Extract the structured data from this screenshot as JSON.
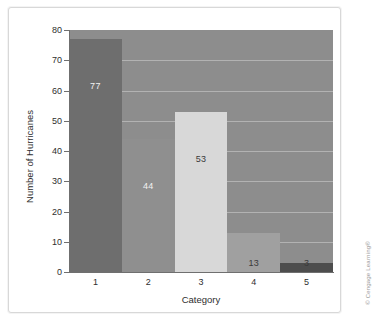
{
  "figure": {
    "credit": "© Cengage Learning®"
  },
  "chart_data": {
    "type": "bar",
    "title": "",
    "xlabel": "Category",
    "ylabel": "Number of Hurricanes",
    "categories": [
      "1",
      "2",
      "3",
      "4",
      "5"
    ],
    "values": [
      77,
      44,
      53,
      13,
      3
    ],
    "value_labels": [
      "77",
      "44",
      "53",
      "13",
      "3"
    ],
    "ylim": [
      0,
      80
    ],
    "yticks": [
      0,
      10,
      20,
      30,
      40,
      50,
      60,
      70,
      80
    ],
    "ytick_labels": [
      "0",
      "10",
      "20",
      "30",
      "40",
      "50",
      "60",
      "70",
      "80"
    ],
    "grid": true,
    "legend": false,
    "plot_background": "#8d8d8d",
    "gridline_color": "#b9b9b9",
    "bar_colors": [
      "#6e6e6e",
      "#8f8f8f",
      "#d8d8d8",
      "#a0a0a0",
      "#4d4d4d"
    ],
    "label_colors": [
      "light",
      "light",
      "dark",
      "dark",
      "dark"
    ]
  }
}
